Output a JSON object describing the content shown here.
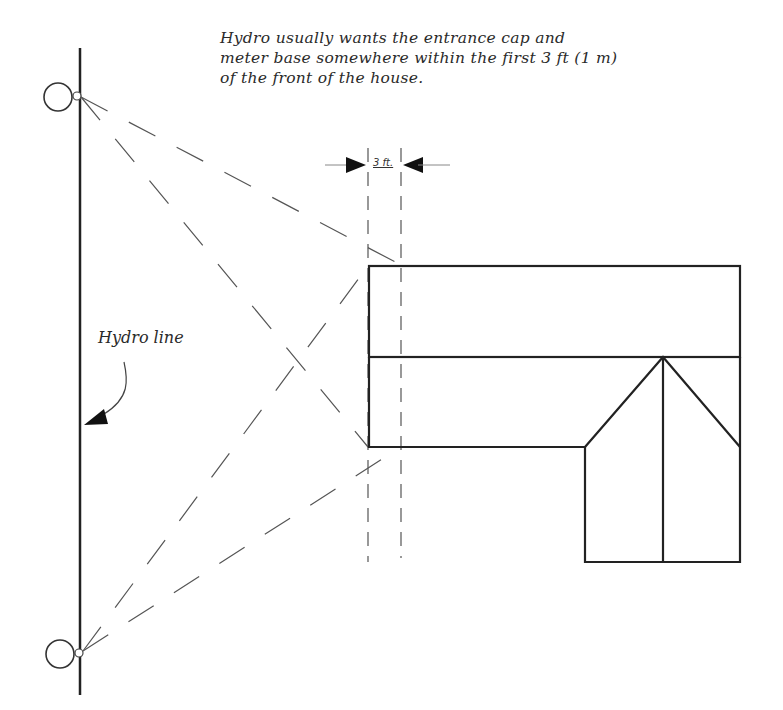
{
  "diagram": {
    "caption": {
      "lines": [
        "Hydro usually wants the entrance cap and",
        "meter base somewhere within the first  3 ft (1 m)",
        "of the front of the house."
      ]
    },
    "labels": {
      "hydro_line": "Hydro line",
      "dimension": "3 ft."
    },
    "elements": {
      "hydro_line": {
        "x": 80,
        "y1": 48,
        "y2": 695
      },
      "poles": [
        {
          "name": "top-pole",
          "cx": 58,
          "cy": 97,
          "r": 14,
          "connector": {
            "cx": 77,
            "cy": 96,
            "r": 4
          }
        },
        {
          "name": "bottom-pole",
          "cx": 60,
          "cy": 654,
          "r": 14,
          "connector": {
            "cx": 79,
            "cy": 653,
            "r": 4
          }
        }
      ],
      "house": {
        "front_left_x": 369,
        "upper_roof": {
          "x1": 369,
          "y1": 266,
          "x2": 740,
          "y2": 357
        },
        "lower_left_bottom_y": 447,
        "gable_left_x": 585,
        "gable_peak": {
          "x": 663,
          "y": 357
        },
        "gable_right_x": 740,
        "gable_eave_y": 447,
        "ell_bottom_y": 562
      },
      "setback_guides": {
        "x_front": 368,
        "x_3ft": 401,
        "y1": 148,
        "y2": 560
      },
      "dimension_arrow_y": 165
    },
    "colors": {
      "stroke": "#222222",
      "dashed": "#555555",
      "text": "#2a2a2a",
      "background": "#ffffff"
    }
  }
}
